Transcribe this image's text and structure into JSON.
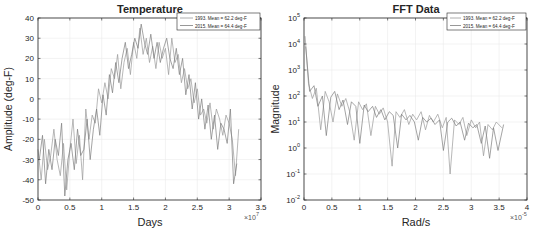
{
  "chart_data": [
    {
      "type": "line",
      "title": "Temperature",
      "xlabel": "Days",
      "ylabel": "Amplitude (deg-F)",
      "x_exponent_label": "×10",
      "x_exponent": "7",
      "xlim": [
        0,
        3.5
      ],
      "ylim": [
        -50,
        40
      ],
      "xticks": [
        0,
        0.5,
        1,
        1.5,
        2,
        2.5,
        3,
        3.5
      ],
      "xtick_labels": [
        "0",
        "0.5",
        "1",
        "1.5",
        "2",
        "2.5",
        "3",
        "3.5"
      ],
      "yticks": [
        40,
        30,
        20,
        10,
        0,
        -10,
        -20,
        -30,
        -40,
        -50
      ],
      "ytick_labels": [
        "40",
        "30",
        "20",
        "10",
        "0",
        "-10",
        "-20",
        "-30",
        "-40",
        "-50"
      ],
      "grid": true,
      "legend_position": "upper right",
      "series": [
        {
          "name": "1993. Mean = 62.2 deg-F",
          "color": "#9a9a9a",
          "x": [
            0.0,
            0.05,
            0.1,
            0.15,
            0.2,
            0.25,
            0.3,
            0.35,
            0.4,
            0.45,
            0.5,
            0.55,
            0.6,
            0.65,
            0.7,
            0.75,
            0.8,
            0.85,
            0.9,
            0.95,
            1.0,
            1.05,
            1.1,
            1.15,
            1.2,
            1.25,
            1.3,
            1.35,
            1.4,
            1.45,
            1.5,
            1.55,
            1.6,
            1.65,
            1.7,
            1.75,
            1.8,
            1.85,
            1.9,
            1.95,
            2.0,
            2.05,
            2.1,
            2.15,
            2.2,
            2.25,
            2.3,
            2.35,
            2.4,
            2.45,
            2.5,
            2.55,
            2.6,
            2.65,
            2.7,
            2.75,
            2.8,
            2.85,
            2.9,
            2.95,
            3.0,
            3.05,
            3.1,
            3.15
          ],
          "y": [
            -25,
            -40,
            -20,
            -35,
            -28,
            -15,
            -30,
            -38,
            -22,
            -45,
            -25,
            -10,
            -32,
            -18,
            -40,
            -5,
            -20,
            -8,
            -12,
            5,
            -2,
            8,
            0,
            15,
            10,
            22,
            5,
            18,
            25,
            12,
            28,
            20,
            35,
            22,
            30,
            18,
            26,
            15,
            28,
            20,
            25,
            12,
            30,
            18,
            22,
            8,
            15,
            5,
            10,
            -2,
            5,
            -8,
            -5,
            -12,
            -2,
            -15,
            -5,
            -10,
            -18,
            -8,
            -12,
            -20,
            -38,
            -15
          ]
        },
        {
          "name": "2015. Mean = 64.4 deg-F",
          "color": "#7d7d7d",
          "x": [
            0.02,
            0.07,
            0.12,
            0.17,
            0.22,
            0.27,
            0.32,
            0.37,
            0.42,
            0.47,
            0.52,
            0.57,
            0.62,
            0.67,
            0.72,
            0.77,
            0.82,
            0.87,
            0.92,
            0.97,
            1.02,
            1.07,
            1.12,
            1.17,
            1.22,
            1.27,
            1.32,
            1.37,
            1.42,
            1.47,
            1.52,
            1.57,
            1.62,
            1.67,
            1.72,
            1.77,
            1.82,
            1.87,
            1.92,
            1.97,
            2.02,
            2.07,
            2.12,
            2.17,
            2.22,
            2.27,
            2.32,
            2.37,
            2.42,
            2.47,
            2.52,
            2.57,
            2.62,
            2.67,
            2.72,
            2.77,
            2.82,
            2.87,
            2.92,
            2.97,
            3.02,
            3.07,
            3.12
          ],
          "y": [
            -30,
            -18,
            -42,
            -25,
            -35,
            -20,
            -28,
            -12,
            -48,
            -30,
            -22,
            -35,
            -15,
            -28,
            -25,
            -10,
            -30,
            -15,
            -5,
            -18,
            2,
            -8,
            12,
            3,
            18,
            8,
            20,
            28,
            15,
            22,
            30,
            25,
            37,
            28,
            22,
            32,
            20,
            28,
            18,
            25,
            30,
            20,
            15,
            25,
            12,
            20,
            2,
            12,
            -5,
            8,
            -10,
            0,
            -15,
            -3,
            -20,
            -8,
            -25,
            -12,
            -15,
            -22,
            -5,
            -42,
            -32
          ]
        }
      ]
    },
    {
      "type": "line",
      "title": "FFT Data",
      "xlabel": "Rad/s",
      "ylabel": "Magnitude",
      "x_exponent_label": "×10",
      "x_exponent": "-5",
      "yscale": "log",
      "xlim": [
        0,
        4
      ],
      "ylim": [
        0.01,
        100000
      ],
      "xticks": [
        0,
        0.5,
        1,
        1.5,
        2,
        2.5,
        3,
        3.5,
        4
      ],
      "xtick_labels": [
        "0",
        "0.5",
        "1",
        "1.5",
        "2",
        "2.5",
        "3",
        "3.5",
        "4"
      ],
      "yticks_exp": [
        5,
        4,
        3,
        2,
        1,
        0,
        -1,
        -2
      ],
      "ytick_labels": [
        "10^5",
        "10^4",
        "10^3",
        "10^2",
        "10^1",
        "10^0",
        "10^-1",
        "10^-2"
      ],
      "grid": true,
      "legend_position": "upper right",
      "series": [
        {
          "name": "1993. Mean = 62.2 deg-F",
          "color": "#9a9a9a",
          "x": [
            0.02,
            0.08,
            0.15,
            0.22,
            0.3,
            0.38,
            0.45,
            0.52,
            0.6,
            0.68,
            0.75,
            0.82,
            0.9,
            0.98,
            1.05,
            1.12,
            1.2,
            1.28,
            1.35,
            1.42,
            1.5,
            1.58,
            1.65,
            1.72,
            1.8,
            1.88,
            1.95,
            2.02,
            2.1,
            2.18,
            2.25,
            2.32,
            2.4,
            2.48,
            2.55,
            2.62,
            2.7,
            2.78,
            2.85,
            2.92,
            3.0,
            3.08,
            3.15,
            3.22,
            3.3,
            3.38,
            3.45,
            3.55
          ],
          "y": [
            20000,
            300,
            80,
            200,
            5,
            150,
            60,
            10,
            120,
            40,
            80,
            25,
            2,
            60,
            30,
            50,
            3,
            40,
            20,
            35,
            10,
            0.2,
            25,
            15,
            30,
            8,
            20,
            12,
            25,
            5,
            18,
            10,
            20,
            6,
            15,
            0.1,
            12,
            8,
            15,
            3,
            12,
            6,
            10,
            0.5,
            8,
            5,
            10,
            6
          ]
        },
        {
          "name": "2015. Mean = 64.4 deg-F",
          "color": "#7d7d7d",
          "x": [
            0.03,
            0.1,
            0.18,
            0.25,
            0.33,
            0.4,
            0.48,
            0.55,
            0.63,
            0.7,
            0.78,
            0.85,
            0.93,
            1.0,
            1.08,
            1.15,
            1.23,
            1.3,
            1.38,
            1.45,
            1.53,
            1.6,
            1.68,
            1.75,
            1.83,
            1.9,
            1.98,
            2.05,
            2.13,
            2.2,
            2.28,
            2.35,
            2.43,
            2.5,
            2.58,
            2.65,
            2.73,
            2.8,
            2.88,
            2.95,
            3.03,
            3.1,
            3.18,
            3.25,
            3.33,
            3.4,
            3.48,
            3.58
          ],
          "y": [
            8000,
            150,
            250,
            40,
            100,
            3,
            90,
            150,
            30,
            70,
            8,
            60,
            40,
            1.5,
            45,
            25,
            40,
            15,
            30,
            12,
            25,
            18,
            1,
            20,
            12,
            18,
            10,
            2,
            15,
            10,
            14,
            8,
            12,
            0.8,
            10,
            14,
            7,
            10,
            2,
            9,
            6,
            8,
            1.5,
            7,
            0.4,
            6,
            0.8,
            8
          ]
        }
      ]
    }
  ],
  "charts": {
    "left": {
      "title": "Temperature",
      "xlabel": "Days",
      "ylabel": "Amplitude (deg-F)",
      "x_exp_base": "×10",
      "x_exp_power": "7",
      "legend": [
        "1993. Mean = 62.2 deg-F",
        "2015. Mean = 64.4 deg-F"
      ]
    },
    "right": {
      "title": "FFT Data",
      "xlabel": "Rad/s",
      "ylabel": "Magnitude",
      "x_exp_base": "×10",
      "x_exp_power": "-5",
      "legend": [
        "1993. Mean = 62.2 deg-F",
        "2015. Mean = 64.4 deg-F"
      ]
    }
  },
  "colors": {
    "axis": "#262626",
    "grid": "#ebebeb",
    "series_1993": "#9a9a9a",
    "series_2015": "#7d7d7d"
  }
}
